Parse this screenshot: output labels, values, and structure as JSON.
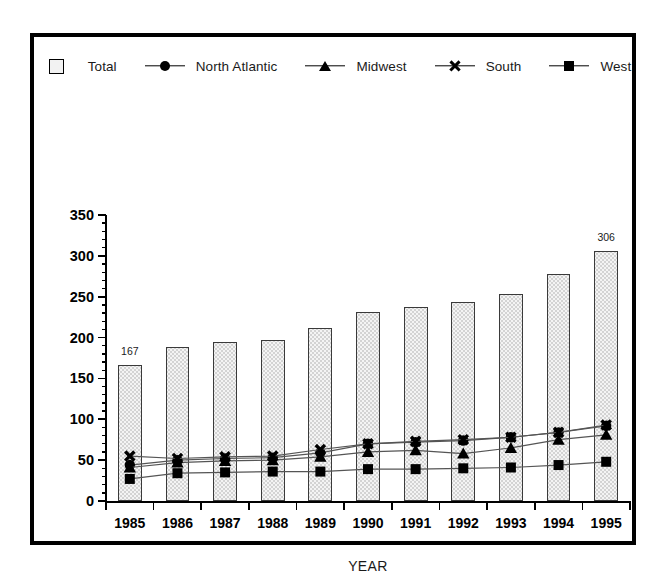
{
  "chart_data": {
    "type": "bar",
    "title": "",
    "xlabel": "YEAR",
    "ylabel": "",
    "categories": [
      "1985",
      "1986",
      "1987",
      "1988",
      "1989",
      "1990",
      "1991",
      "1992",
      "1993",
      "1994",
      "1995"
    ],
    "ylim": [
      0,
      350
    ],
    "ytick_values": [
      0,
      50,
      100,
      150,
      200,
      250,
      300,
      350
    ],
    "ytick_labels": [
      "0",
      "50",
      "100",
      "150",
      "200",
      "250",
      "300",
      "350"
    ],
    "minor_tick_interval": 10,
    "grid": false,
    "legend_position": "top-center",
    "bar_series": {
      "name": "Total",
      "values": [
        167,
        189,
        195,
        197,
        212,
        231,
        237,
        244,
        253,
        278,
        306
      ],
      "labeled_points": [
        {
          "category": "1985",
          "value": 167,
          "label": "167"
        },
        {
          "category": "1995",
          "value": 306,
          "label": "306"
        }
      ]
    },
    "series": [
      {
        "name": "North Atlantic",
        "marker": "circle",
        "values": [
          44,
          50,
          52,
          53,
          59,
          70,
          72,
          74,
          78,
          84,
          92
        ]
      },
      {
        "name": "Midwest",
        "marker": "triangle",
        "values": [
          41,
          47,
          49,
          50,
          54,
          60,
          62,
          58,
          65,
          75,
          81
        ]
      },
      {
        "name": "South",
        "marker": "x",
        "values": [
          55,
          52,
          54,
          55,
          63,
          70,
          73,
          75,
          78,
          84,
          93
        ]
      },
      {
        "name": "West",
        "marker": "square",
        "values": [
          27,
          34,
          35,
          36,
          36,
          39,
          39,
          40,
          41,
          44,
          48
        ]
      }
    ]
  },
  "legend": {
    "entries": [
      {
        "label": "Total",
        "key": "swatch-stipple"
      },
      {
        "label": "North Atlantic",
        "key": "line-circle"
      },
      {
        "label": "Midwest",
        "key": "line-triangle"
      },
      {
        "label": "South",
        "key": "line-x"
      },
      {
        "label": "West",
        "key": "line-square"
      }
    ]
  },
  "colors": {
    "frame": "#000000",
    "marker": "#000000",
    "bar_fill": "#f4f4f4",
    "bar_stipple": "#a6a6a6",
    "bar_edge": "#3a3a3a",
    "line": "#555555",
    "text": "#000000"
  }
}
